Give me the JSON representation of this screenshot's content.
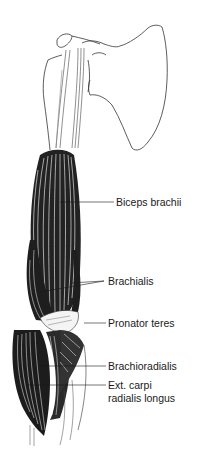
{
  "figure": {
    "labels": [
      {
        "id": "biceps",
        "text": "Biceps brachii"
      },
      {
        "id": "brachialis",
        "text": "Brachialis"
      },
      {
        "id": "pronator",
        "text": "Pronator teres"
      },
      {
        "id": "brachioradialis",
        "text": "Brachioradialis"
      },
      {
        "id": "ecrl_line1",
        "text": "Ext. carpi"
      },
      {
        "id": "ecrl_line2",
        "text": "radialis longus"
      }
    ]
  },
  "colors": {
    "ink": "#1a1a1a",
    "background": "#ffffff"
  }
}
